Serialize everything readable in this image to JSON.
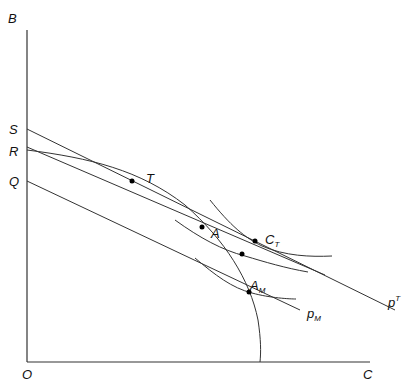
{
  "diagram": {
    "axes": {
      "y_label": "B",
      "x_label": "C",
      "origin_label": "O"
    },
    "intercepts": {
      "S": "S",
      "R": "R",
      "Q": "Q"
    },
    "points": {
      "T": "T",
      "A": "A",
      "C_T": {
        "base": "C",
        "sub": "T"
      },
      "A_M": {
        "base": "A",
        "sub": "M"
      }
    },
    "price_lines": {
      "p_T": {
        "base": "p",
        "sup": "T"
      },
      "p_M": {
        "base": "p",
        "sub": "M"
      }
    },
    "colors": {
      "line": "#333333",
      "point": "#000000",
      "background": "#ffffff"
    }
  }
}
